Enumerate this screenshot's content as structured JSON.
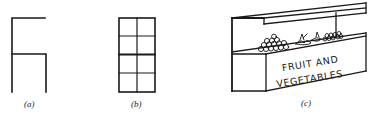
{
  "figure": {
    "panels": [
      {
        "id": "a",
        "label": "(a)",
        "description": "Open frame: two stacked compartments, top one open on right side"
      },
      {
        "id": "b",
        "label": "(b)",
        "description": "Grid of 2 columns by 4 rows"
      },
      {
        "id": "c",
        "label": "(c)",
        "description": "Market stall with roof and sign",
        "sign_line1": "FRUIT AND",
        "sign_line2": "VEGETABLES"
      }
    ],
    "line_color": "#1a1a1a",
    "background": "#ffffff"
  }
}
